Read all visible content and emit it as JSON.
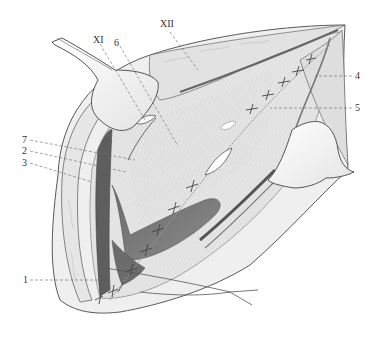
{
  "figure": {
    "type": "surgical anatomical illustration",
    "style": "grayscale pencil drawing",
    "colors": {
      "background": "#ffffff",
      "outline": "#555555",
      "tissue_light": "#ececec",
      "tissue_mid": "#c9c9c9",
      "tissue_dark": "#7a7a7a",
      "muscle_dark": "#5e5e5e",
      "leader_line": "#666666",
      "label_text": "#333333"
    },
    "labels": [
      {
        "id": "XI",
        "text": "XI",
        "x": 96,
        "y": 37
      },
      {
        "id": "6",
        "text": "6",
        "x": 116,
        "y": 40
      },
      {
        "id": "XII",
        "text": "XII",
        "x": 160,
        "y": 21
      },
      {
        "id": "4",
        "text": "4",
        "x": 357,
        "y": 73
      },
      {
        "id": "5",
        "text": "5",
        "x": 357,
        "y": 105
      },
      {
        "id": "7",
        "text": "7",
        "x": 21,
        "y": 135
      },
      {
        "id": "2",
        "text": "2",
        "x": 21,
        "y": 146
      },
      {
        "id": "3",
        "text": "3",
        "x": 21,
        "y": 158
      },
      {
        "id": "1",
        "text": "1",
        "x": 22,
        "y": 276
      }
    ],
    "structures": [
      "upper-left retractor",
      "right retractor",
      "sutured fascial incision",
      "dark muscle region",
      "vessels and nerves",
      "skin edges"
    ]
  }
}
